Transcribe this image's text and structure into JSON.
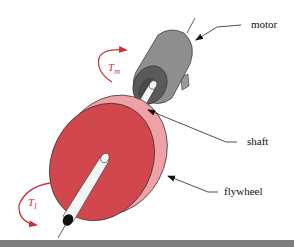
{
  "diagram": {
    "type": "mechanical-system",
    "components": [
      {
        "id": "motor",
        "label": "motor",
        "color": "#8e8e8e"
      },
      {
        "id": "shaft",
        "label": "shaft",
        "color": "#f2f2f2"
      },
      {
        "id": "flywheel",
        "label": "flywheel",
        "color": "#d2464d"
      }
    ],
    "labels": {
      "motor": "motor",
      "shaft": "shaft",
      "flywheel": "flywheel"
    },
    "torques": {
      "motor": {
        "symbol": "T",
        "subscript": "m"
      },
      "load": {
        "symbol": "T",
        "subscript": "l"
      }
    },
    "colors": {
      "flywheel_face": "#d2464d",
      "flywheel_rim": "#eea2a6",
      "motor_body": "#8e8e8e",
      "motor_end": "#5a5a5a",
      "torque_arrow": "#c8333b",
      "leader_line": "#222222",
      "bottom_band": "#7d7d7d"
    }
  }
}
